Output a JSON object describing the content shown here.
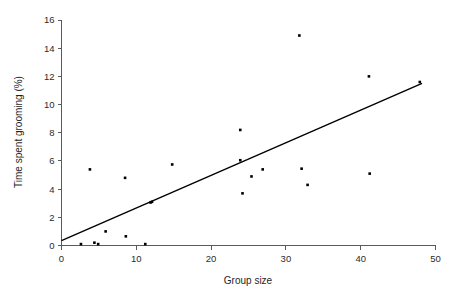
{
  "chart_data": {
    "type": "scatter",
    "title": "",
    "xlabel": "Group size",
    "ylabel": "Time spent grooming (%)",
    "xlim": [
      0,
      50
    ],
    "ylim": [
      0,
      16
    ],
    "xticks": [
      0,
      10,
      20,
      30,
      40,
      50
    ],
    "yticks": [
      0,
      2,
      4,
      6,
      8,
      10,
      12,
      14,
      16
    ],
    "xtick_labels": [
      "0",
      "10",
      "20",
      "30",
      "40",
      "50"
    ],
    "ytick_labels": [
      "0",
      "2",
      "4",
      "6",
      "8",
      "10",
      "12",
      "14",
      "16"
    ],
    "grid": false,
    "legend": null,
    "marker": "filled-square",
    "marker_color": "#000000",
    "points": [
      {
        "x": 2.6,
        "y": 0.1
      },
      {
        "x": 3.8,
        "y": 5.4
      },
      {
        "x": 4.4,
        "y": 0.2
      },
      {
        "x": 4.9,
        "y": 0.1
      },
      {
        "x": 5.9,
        "y": 1.0
      },
      {
        "x": 8.5,
        "y": 4.8
      },
      {
        "x": 8.6,
        "y": 0.65
      },
      {
        "x": 11.2,
        "y": 0.1
      },
      {
        "x": 11.9,
        "y": 3.05
      },
      {
        "x": 12.1,
        "y": 3.1
      },
      {
        "x": 14.8,
        "y": 5.75
      },
      {
        "x": 23.9,
        "y": 8.2
      },
      {
        "x": 23.9,
        "y": 6.05
      },
      {
        "x": 24.2,
        "y": 3.7
      },
      {
        "x": 25.4,
        "y": 4.9
      },
      {
        "x": 26.9,
        "y": 5.4
      },
      {
        "x": 31.8,
        "y": 14.9
      },
      {
        "x": 32.1,
        "y": 5.45
      },
      {
        "x": 32.9,
        "y": 4.3
      },
      {
        "x": 41.1,
        "y": 12.0
      },
      {
        "x": 41.2,
        "y": 5.1
      },
      {
        "x": 47.9,
        "y": 11.6
      }
    ],
    "fit_line": {
      "type": "linear-regression",
      "x_start": 0,
      "y_start": 0.35,
      "x_end": 48.2,
      "y_end": 11.5,
      "color": "#000000"
    }
  }
}
